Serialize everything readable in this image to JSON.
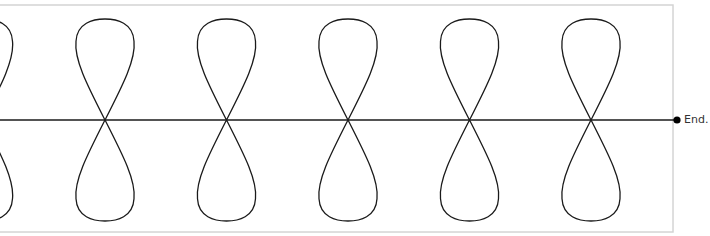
{
  "diagram": {
    "type": "figure-eight-loops-on-line",
    "loop_count_full": 5,
    "loop_count_partial_left": 1,
    "end_label": "End.",
    "colors": {
      "stroke": "#1a1a1a",
      "frame": "#d4d4d4",
      "background": "#ffffff",
      "end_dot": "#000000",
      "label": "#333333"
    }
  }
}
